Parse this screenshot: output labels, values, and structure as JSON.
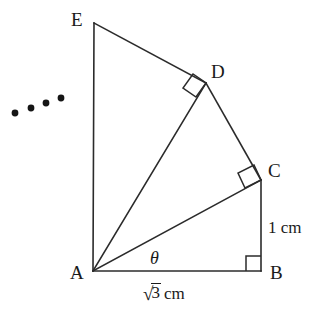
{
  "figure": {
    "kind": "geometry-diagram",
    "stroke_color": "#2b2b2b",
    "text_color": "#1a1a1a",
    "background_color": "#ffffff"
  },
  "vertices": [
    {
      "id": "E",
      "label": "E",
      "x": 94,
      "y": 23,
      "label_x": 71,
      "label_y": 10
    },
    {
      "id": "D",
      "label": "D",
      "x": 206,
      "y": 83,
      "label_x": 211,
      "label_y": 62
    },
    {
      "id": "C",
      "label": "C",
      "x": 261,
      "y": 180,
      "label_x": 268,
      "label_y": 161
    },
    {
      "id": "B",
      "label": "B",
      "x": 261,
      "y": 271,
      "label_x": 270,
      "label_y": 263
    },
    {
      "id": "A",
      "label": "A",
      "x": 93,
      "y": 271,
      "label_x": 70,
      "label_y": 263
    }
  ],
  "segments": [
    {
      "name": "segment-a-b",
      "from": "A",
      "to": "B"
    },
    {
      "name": "segment-b-c",
      "from": "B",
      "to": "C"
    },
    {
      "name": "segment-a-c",
      "from": "A",
      "to": "C"
    },
    {
      "name": "segment-c-d",
      "from": "C",
      "to": "D"
    },
    {
      "name": "segment-a-d",
      "from": "A",
      "to": "D"
    },
    {
      "name": "segment-d-e",
      "from": "D",
      "to": "E"
    },
    {
      "name": "segment-a-e",
      "from": "A",
      "to": "E"
    }
  ],
  "right_angles": [
    {
      "name": "right-angle-b",
      "at": "B",
      "style": "axis-aligned"
    },
    {
      "name": "right-angle-c",
      "at": "C",
      "style": "rotated"
    },
    {
      "name": "right-angle-d",
      "at": "D",
      "style": "rotated"
    }
  ],
  "angle_marks": [
    {
      "name": "angle-theta",
      "symbol": "θ",
      "at": "A",
      "between": [
        "A-B",
        "A-C"
      ],
      "x": 150,
      "y": 249
    }
  ],
  "measurements": [
    {
      "name": "label-bc-length",
      "text": "1 cm",
      "value": "1",
      "unit": "cm",
      "side": "BC",
      "x": 268,
      "y": 219
    },
    {
      "name": "label-ab-length",
      "text": "√3 cm",
      "radicand": "3",
      "unit": "cm",
      "side": "AB",
      "x": 143,
      "y": 286
    }
  ],
  "ellipsis_dots": {
    "name": "continuation-dots",
    "count": 4,
    "points": [
      {
        "x": 15,
        "y": 113
      },
      {
        "x": 31,
        "y": 108
      },
      {
        "x": 46,
        "y": 103
      },
      {
        "x": 61,
        "y": 98
      }
    ],
    "radius": 3.3
  }
}
